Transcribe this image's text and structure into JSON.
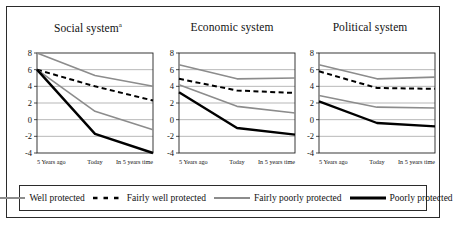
{
  "figure": {
    "panel_count": 3,
    "legend": {
      "items": [
        {
          "label": "Well protected",
          "style": "solid",
          "color": "#8c8c8c",
          "width": 1.6
        },
        {
          "label": "Fairly well protected",
          "style": "dashed",
          "color": "#000000",
          "width": 2.0
        },
        {
          "label": "Fairly poorly protected",
          "style": "solid",
          "color": "#8c8c8c",
          "width": 1.6
        },
        {
          "label": "Poorly protected",
          "style": "solid",
          "color": "#000000",
          "width": 2.4
        }
      ]
    }
  },
  "chart_data": [
    {
      "type": "line",
      "title": "Social system",
      "title_superscript": "a",
      "xlabel": "",
      "ylabel": "",
      "categories": [
        "5 Years ago",
        "Today",
        "In 5 years time"
      ],
      "ylim": [
        -4,
        8
      ],
      "yticks": [
        8,
        6,
        4,
        2,
        0,
        -2,
        -4
      ],
      "grid": true,
      "legend_position": "bottom-shared",
      "series": [
        {
          "name": "Well protected",
          "values": [
            8.0,
            5.3,
            4.0
          ]
        },
        {
          "name": "Fairly well protected",
          "values": [
            6.0,
            4.0,
            2.3
          ]
        },
        {
          "name": "Fairly poorly protected",
          "values": [
            6.0,
            1.0,
            -1.2
          ]
        },
        {
          "name": "Poorly protected",
          "values": [
            6.0,
            -1.7,
            -4.0
          ]
        }
      ]
    },
    {
      "type": "line",
      "title": "Economic system",
      "title_superscript": "",
      "xlabel": "",
      "ylabel": "",
      "categories": [
        "5 Years ago",
        "Today",
        "In 5 years time"
      ],
      "ylim": [
        -4,
        8
      ],
      "yticks": [
        8,
        6,
        4,
        2,
        0,
        -2,
        -4
      ],
      "grid": true,
      "legend_position": "bottom-shared",
      "series": [
        {
          "name": "Well protected",
          "values": [
            6.6,
            4.9,
            5.0
          ]
        },
        {
          "name": "Fairly well protected",
          "values": [
            4.9,
            3.5,
            3.2
          ]
        },
        {
          "name": "Fairly poorly protected",
          "values": [
            4.2,
            1.6,
            0.8
          ]
        },
        {
          "name": "Poorly protected",
          "values": [
            3.3,
            -1.0,
            -1.8
          ]
        }
      ]
    },
    {
      "type": "line",
      "title": "Political system",
      "title_superscript": "",
      "xlabel": "",
      "ylabel": "",
      "categories": [
        "5 Years ago",
        "Today",
        "In 5 years time"
      ],
      "ylim": [
        -4,
        8
      ],
      "yticks": [
        8,
        6,
        4,
        2,
        0,
        -2,
        -4
      ],
      "grid": true,
      "legend_position": "bottom-shared",
      "series": [
        {
          "name": "Well protected",
          "values": [
            6.6,
            4.9,
            5.1
          ]
        },
        {
          "name": "Fairly well protected",
          "values": [
            5.8,
            3.8,
            3.7
          ]
        },
        {
          "name": "Fairly poorly protected",
          "values": [
            2.9,
            1.5,
            1.4
          ]
        },
        {
          "name": "Poorly protected",
          "values": [
            2.2,
            -0.4,
            -0.8
          ]
        }
      ]
    }
  ]
}
